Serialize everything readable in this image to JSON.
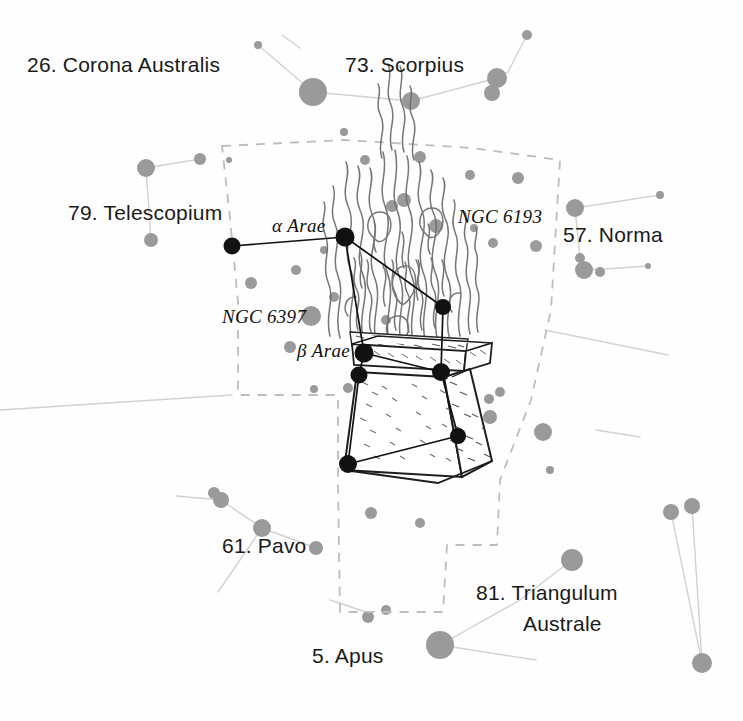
{
  "plate": {
    "title": "Ara constellation star chart plate",
    "background_color": "#fefefe",
    "ink_color": "#1a1a1a",
    "star_color": "#8e8e8e",
    "line_color": "#cfcfcf",
    "boundary_color": "#bdbdbd",
    "bright_star_color": "#111111"
  },
  "constellation_labels": [
    {
      "id": "corona-australis",
      "text": "26. Corona Australis",
      "x": 27,
      "y": 62,
      "anchor": "left"
    },
    {
      "id": "scorpius",
      "text": "73. Scorpius",
      "x": 345,
      "y": 60,
      "anchor": "left"
    },
    {
      "id": "telescopium",
      "text": "79. Telescopium",
      "x": 68,
      "y": 200,
      "anchor": "left"
    },
    {
      "id": "norma",
      "text": "57. Norma",
      "x": 563,
      "y": 222,
      "anchor": "left"
    },
    {
      "id": "pavo",
      "text": "61. Pavo",
      "x": 222,
      "y": 533,
      "anchor": "left"
    },
    {
      "id": "triangulum-australe-line1",
      "text": "81. Triangulum",
      "x": 476,
      "y": 580,
      "anchor": "left"
    },
    {
      "id": "triangulum-australe-line2",
      "text": "Australe",
      "x": 523,
      "y": 611,
      "anchor": "left"
    },
    {
      "id": "apus",
      "text": "5. Apus",
      "x": 312,
      "y": 643,
      "anchor": "left"
    }
  ],
  "object_labels": [
    {
      "id": "alpha-arae",
      "text": "α Arae",
      "x": 272,
      "y": 215,
      "align": "left"
    },
    {
      "id": "ngc-6193",
      "text": "NGC 6193",
      "x": 458,
      "y": 206,
      "align": "left"
    },
    {
      "id": "ngc-6397",
      "text": "NGC 6397",
      "x": 222,
      "y": 306,
      "align": "left"
    },
    {
      "id": "beta-arae",
      "text": "β Arae",
      "x": 297,
      "y": 340,
      "align": "left"
    }
  ],
  "named_stars": [
    {
      "id": "alpha-arae-star",
      "label": "α Arae",
      "x": 345,
      "y": 237,
      "r": 9.5,
      "kind": "bright"
    },
    {
      "id": "beta-arae-star",
      "label": "β Arae",
      "x": 364,
      "y": 353,
      "r": 9.5,
      "kind": "bright"
    },
    {
      "id": "gamma-arae-star",
      "label": "γ Arae",
      "x": 359,
      "y": 375,
      "r": 8.5,
      "kind": "bright"
    },
    {
      "id": "delta-arae-star",
      "label": "δ Arae",
      "x": 441,
      "y": 372,
      "r": 9.0,
      "kind": "bright"
    },
    {
      "id": "zeta-arae-star",
      "label": "ζ Arae",
      "x": 443,
      "y": 307,
      "r": 8.0,
      "kind": "bright"
    },
    {
      "id": "eta-arae-star",
      "label": "η Arae",
      "x": 348,
      "y": 464,
      "r": 9.0,
      "kind": "bright"
    },
    {
      "id": "theta-arae-star",
      "label": "θ Arae",
      "x": 458,
      "y": 436,
      "r": 8.0,
      "kind": "bright"
    },
    {
      "id": "epsilon-arae-star",
      "label": "ε Arae",
      "x": 232,
      "y": 246,
      "r": 8.5,
      "kind": "bright"
    }
  ],
  "ara_figure": {
    "name": "flaming altar",
    "description": "Ara, the Altar, drawn as a stone brazier with a rising flame"
  },
  "boundary": {
    "name": "ara-constellation-boundary",
    "style": "dashed"
  }
}
